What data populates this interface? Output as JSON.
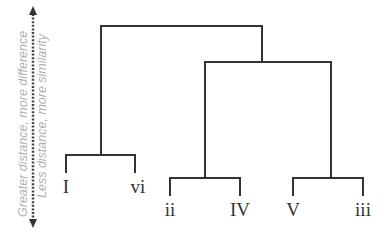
{
  "axis": {
    "line1": "Greater distance, more difference",
    "line2": "Less distance, more similarity",
    "arrow": "double-headed-dotted-arrow"
  },
  "leaves": [
    {
      "label": "I"
    },
    {
      "label": "vi"
    },
    {
      "label": "ii"
    },
    {
      "label": "IV"
    },
    {
      "label": "V"
    },
    {
      "label": "iii"
    }
  ],
  "colors": {
    "branch": "#333333",
    "axis_text": "#b0b0b0",
    "background": "#ffffff"
  }
}
